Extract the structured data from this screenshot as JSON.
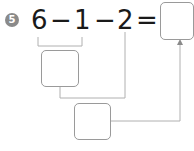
{
  "problem": {
    "number": "5",
    "tokens": [
      "6",
      "−",
      "1",
      "−",
      "2",
      "="
    ],
    "answer_box": "",
    "step_box_1": "",
    "step_box_2": ""
  },
  "colors": {
    "badge": "#8a8a8a",
    "line": "#b0b0b0",
    "box_border": "#9a9a9a",
    "text": "#1a1a1a"
  }
}
